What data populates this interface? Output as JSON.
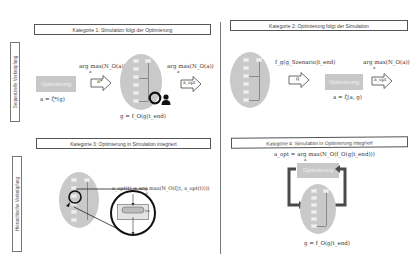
{
  "diagram": {
    "side_labels": {
      "sequential": "Sequenzielle Verknüpfung",
      "hierarchical": "Hierarchische Verknüpfung"
    },
    "categories": [
      {
        "title": "Kategorie 1: Simulation folgt der Optimierung",
        "optimizer_label": "Optimierung",
        "optimizer_formula": "a = ζ*(g)",
        "argmax_formula": "arg max(N_O(a))",
        "argmax_sub": "a",
        "arrow1_label": "a*",
        "sim_formula": "g = f_O(g|t_end)",
        "arrow2_label": "a_opt",
        "argmax2_formula": "arg max(N_O(a))",
        "argmax2_sub": "a"
      },
      {
        "title": "Kategorie 2: Optimierung folgt der Simulation",
        "sim_formula": "f_g(g_Szenario|t_end)",
        "arrow1_label": "g",
        "optimizer_label": "Optimierung",
        "optimizer_formula": "a = ζ(a, g)",
        "argmax_formula": "arg max(N_O(a))",
        "argmax_sub": "a",
        "arrow2_label": "a_opt"
      },
      {
        "title": "Kategorie 3: Optimierung in Simulation integriert",
        "formula": "x_opt(t) = arg max(N_O(ζ(t, x_opt(t))))",
        "formula_sub": "x"
      },
      {
        "title": "Kategorie 4: Simulation in Optimierung integriert",
        "formula": "a_opt = arg max(N_O(f_O(g|t_end)))",
        "formula_sub": "a",
        "optimizer_label": "Optimierung",
        "sim_formula": "g = f_O(g|t_end)"
      }
    ],
    "colors": {
      "ellipse": "#c9c9c9",
      "optimizer_box": "#c8c8c8",
      "loop_arrow": "#4a4a4a",
      "border": "#555555"
    }
  }
}
